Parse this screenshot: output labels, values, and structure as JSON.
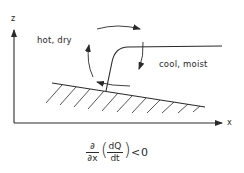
{
  "diagram": {
    "axes": {
      "vertical_label": "z",
      "horizontal_label": "x"
    },
    "regions": {
      "left_label": "hot, dry",
      "right_label": "cool, moist"
    },
    "equation": {
      "operator_num": "∂",
      "operator_den": "∂x",
      "inner_num": "dQ",
      "inner_den": "dt",
      "open_paren": "(",
      "close_paren": ")",
      "relation": "<",
      "rhs": "0"
    },
    "colors": {
      "ink": "#2a2a2a",
      "background": "#ffffff"
    }
  }
}
